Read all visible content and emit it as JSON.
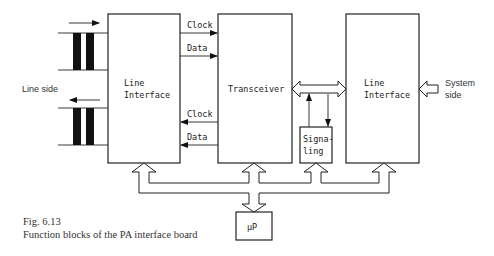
{
  "diagram": {
    "left_label": "Line side",
    "right_label_line1": "System",
    "right_label_line2": "side",
    "blocks": {
      "line_interface_left": {
        "line1": "Line",
        "line2": "Interface"
      },
      "transceiver": {
        "label": "Transceiver"
      },
      "line_interface_right": {
        "line1": "Line",
        "line2": "Interface"
      },
      "signaling": {
        "line1": "Signa-",
        "line2": "ling"
      },
      "microprocessor": {
        "label": "µP"
      }
    },
    "signals": {
      "top_clock": "Clock",
      "top_data": "Data",
      "bottom_clock": "Clock",
      "bottom_data": "Data"
    }
  },
  "caption": {
    "figure_number": "Fig. 6.13",
    "text": "Function blocks of the PA interface board"
  }
}
